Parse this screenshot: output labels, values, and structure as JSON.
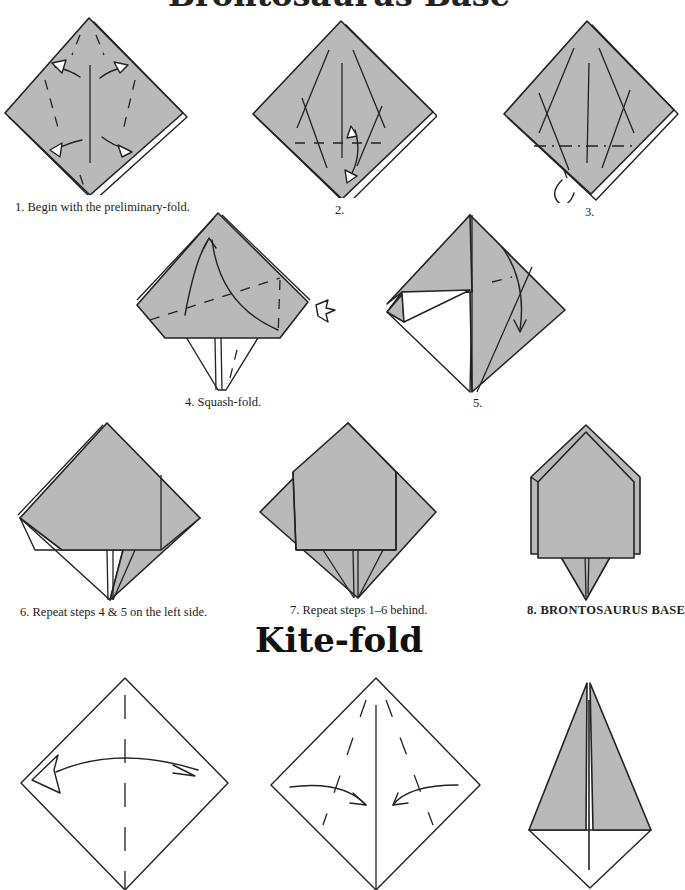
{
  "page": {
    "top_heading": "Brontosaurus Base",
    "section_title": "Kite-fold"
  },
  "colors": {
    "paper_colored": "#b9b9b9",
    "paper_white": "#ffffff",
    "line": "#222222"
  },
  "brontosaurus_steps": [
    {
      "number": 1,
      "caption": "1.  Begin with the preliminary-fold."
    },
    {
      "number": 2,
      "caption": "2."
    },
    {
      "number": 3,
      "caption": "3."
    },
    {
      "number": 4,
      "caption": "4.  Squash-fold."
    },
    {
      "number": 5,
      "caption": "5."
    },
    {
      "number": 6,
      "caption": "6.  Repeat steps 4 & 5 on the left side."
    },
    {
      "number": 7,
      "caption": "7.  Repeat steps 1–6 behind."
    },
    {
      "number": 8,
      "caption": "8.  BRONTOSAURUS BASE"
    }
  ],
  "kite_steps": [
    {
      "icon": "valley-fold-diagonal-unfold"
    },
    {
      "icon": "fold-edges-to-center"
    },
    {
      "icon": "kite-result"
    }
  ]
}
